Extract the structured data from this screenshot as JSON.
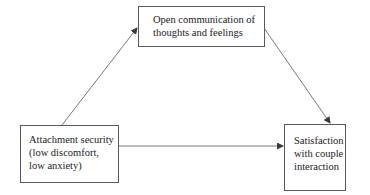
{
  "diagram": {
    "type": "mediation-model",
    "nodes": {
      "mediator": {
        "lines": [
          "Open communication of",
          "thoughts and feelings"
        ]
      },
      "predictor": {
        "lines": [
          "Attachment security",
          "(low discomfort,",
          "low anxiety)"
        ]
      },
      "outcome": {
        "lines": [
          "Satisfaction",
          "with couple",
          "interaction"
        ]
      }
    },
    "edges": [
      {
        "from": "predictor",
        "to": "mediator"
      },
      {
        "from": "mediator",
        "to": "outcome"
      },
      {
        "from": "predictor",
        "to": "outcome"
      }
    ],
    "colors": {
      "stroke": "#5a5a5a",
      "text": "#222222",
      "background": "#ffffff"
    }
  }
}
